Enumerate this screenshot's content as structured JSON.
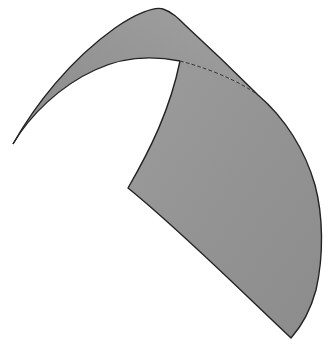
{
  "figure": {
    "background_color": "#ffffff",
    "surface_color_light": "#a3a3a3",
    "surface_color_dark": "#8a8a8a",
    "outline_color": "#222222",
    "fold_line_style": "dashed"
  }
}
